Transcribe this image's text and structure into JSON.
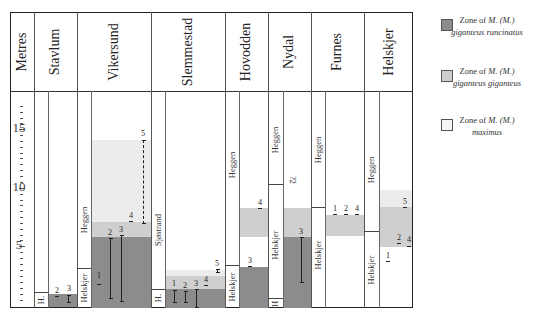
{
  "axis": {
    "label": "Metres",
    "ticks": [
      {
        "value": "15",
        "y": 129
      },
      {
        "value": "10",
        "y": 188
      },
      {
        "value": "5",
        "y": 246
      }
    ],
    "range": [
      0,
      18
    ]
  },
  "columns": [
    {
      "name": "Stavlum",
      "formations": [
        {
          "label": "H.",
          "from": 0,
          "to": 1.3
        }
      ]
    },
    {
      "name": "Vikersund",
      "formations": [
        {
          "label": "Helskjer",
          "from": 0,
          "to": 3.4
        },
        {
          "label": "Heggen",
          "from": 3.4,
          "to": 18
        }
      ]
    },
    {
      "name": "Slemmestad",
      "formations": [
        {
          "label": "H.",
          "from": 0,
          "to": 1.5
        },
        {
          "label": "Sjøstrand",
          "from": 1.5,
          "to": 18
        }
      ]
    },
    {
      "name": "Hovodden",
      "formations": [
        {
          "label": "Helskjer",
          "from": 0,
          "to": 3.5
        },
        {
          "label": "Heggen",
          "from": 3.5,
          "to": 18
        }
      ]
    },
    {
      "name": "Nydal",
      "formations": [
        {
          "label": "H",
          "from": 0,
          "to": 1
        },
        {
          "label": "Helskjer",
          "from": 1,
          "to": 10.4
        },
        {
          "label": "Heggen",
          "from": 10.4,
          "to": 18
        }
      ]
    },
    {
      "name": "Furnes",
      "formations": [
        {
          "label": "Helskjer",
          "from": 0,
          "to": 8.4
        },
        {
          "label": "Heggen",
          "from": 8.4,
          "to": 18
        }
      ]
    },
    {
      "name": "Helskjer",
      "formations": [
        {
          "label": "Helskjer",
          "from": 0,
          "to": 6.4
        },
        {
          "label": "Heggen",
          "from": 6.4,
          "to": 18
        }
      ]
    }
  ],
  "samples": {
    "stavlum": [
      "2",
      "3"
    ],
    "vikersund": [
      "1",
      "2",
      "3",
      "4",
      "5"
    ],
    "slemmestad": [
      "1",
      "2",
      "3",
      "4",
      "5"
    ],
    "hovodden": [
      "3",
      "4"
    ],
    "nydal": [
      "?2",
      "3"
    ],
    "furnes": [
      "1",
      "2",
      "4"
    ],
    "helskjer": [
      "1",
      "2",
      "4",
      "5"
    ]
  },
  "legend": [
    {
      "prefix": "Zone of ",
      "taxon": "M. (M.)",
      "subtaxon": "giganteus runcinatus",
      "color": "#8c8c8c"
    },
    {
      "prefix": "Zone of ",
      "taxon": "M. (M.)",
      "subtaxon": "giganteus giganteus",
      "color": "#cfcfcf"
    },
    {
      "prefix": "Zone of ",
      "taxon": "M. (M.)",
      "subtaxon": "maximus",
      "color": "#ececec"
    }
  ],
  "colors": {
    "runcinatus": "#8c8c8c",
    "giganteus": "#cfcfcf",
    "maximus": "#ececec",
    "frame": "#222222"
  }
}
